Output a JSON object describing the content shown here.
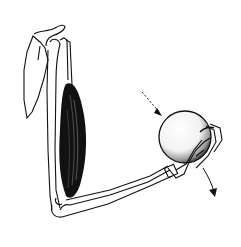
{
  "illustration": {
    "subject": "arm-flexion-anatomy",
    "parts": [
      "scapula",
      "humerus",
      "biceps-muscle",
      "forearm-bones",
      "hand",
      "ball"
    ],
    "arrows": [
      {
        "name": "load-arrow",
        "style": "dashed"
      },
      {
        "name": "motion-arrow",
        "style": "solid"
      }
    ],
    "colors": {
      "ink": "#111111",
      "paper": "#ffffff",
      "ball_shade": "#bbbbbb"
    }
  }
}
